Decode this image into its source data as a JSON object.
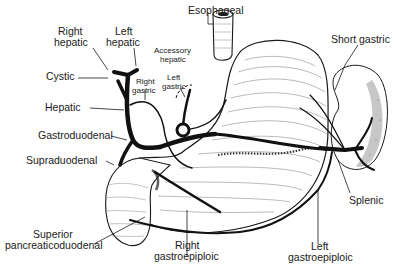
{
  "diagram": {
    "colors": {
      "ink": "#1a1a1a",
      "background": "#ffffff",
      "organ_fill": "#ffffff",
      "spleen_stipple": "#555555"
    },
    "labels": {
      "esophageal": "Esophageal",
      "right_hepatic_1": "Right",
      "right_hepatic_2": "hepatic",
      "left_hepatic_1": "Left",
      "left_hepatic_2": "hepatic",
      "accessory_hepatic_1": "Accessory",
      "accessory_hepatic_2": "hepatic",
      "cystic": "Cystic",
      "right_gastric_1": "Right",
      "right_gastric_2": "gastric",
      "left_gastric_1": "Left",
      "left_gastric_2": "gastric",
      "hepatic": "Hepatic",
      "gastroduodenal": "Gastroduodenal",
      "supraduodenal": "Supraduodenal",
      "superior_pd_1": "Superior",
      "superior_pd_2": "pancreaticoduodenal",
      "right_gastroepiploic_1": "Right",
      "right_gastroepiploic_2": "gastroepiploic",
      "left_gastroepiploic_1": "Left",
      "left_gastroepiploic_2": "gastroepiploic",
      "short_gastric": "Short gastric",
      "splenic": "Splenic"
    }
  }
}
